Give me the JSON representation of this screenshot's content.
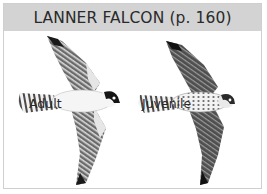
{
  "header": {
    "title": "LANNER FALCON (p. 160)"
  },
  "plates": [
    {
      "label": "Adult",
      "icon": "falcon-adult-illustration"
    },
    {
      "label": "Juvenile",
      "icon": "falcon-juvenile-illustration"
    }
  ],
  "colors": {
    "header_bg": "#d3d3d3",
    "border": "#cfcfcf",
    "text": "#2a2a2a"
  }
}
